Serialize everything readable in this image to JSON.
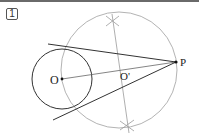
{
  "problem": {
    "number": "1"
  },
  "diagram": {
    "labels": {
      "O": "O",
      "O_prime": "O'",
      "P": "P"
    },
    "colors": {
      "dark_line": "#333333",
      "light_line": "#999999",
      "point": "#111111",
      "topbar": "#6a6a6a"
    },
    "elements": [
      "circle centered at O",
      "circle centered at O' through O and P",
      "segment OP",
      "perpendicular bisector of OP with construction arc marks",
      "two tangent lines from P to circle O"
    ]
  }
}
